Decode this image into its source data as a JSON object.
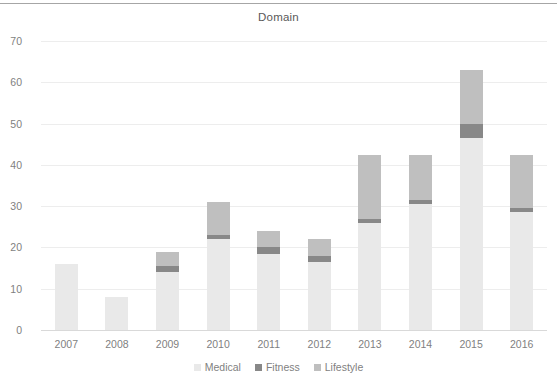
{
  "chart_data": {
    "type": "bar",
    "title": "Domain",
    "xlabel": "",
    "ylabel": "",
    "ylim": [
      0,
      70
    ],
    "yticks": [
      0,
      10,
      20,
      30,
      40,
      50,
      60,
      70
    ],
    "ytick_labels": [
      "0",
      "10",
      "20",
      "30",
      "40",
      "50",
      "60",
      "70"
    ],
    "grid": true,
    "stacked": true,
    "legend_position": "bottom",
    "categories": [
      "2007",
      "2008",
      "2009",
      "2010",
      "2011",
      "2012",
      "2013",
      "2014",
      "2015",
      "2016"
    ],
    "series": [
      {
        "name": "Medical",
        "color": "#e9e9e9",
        "values": [
          16,
          8,
          14,
          22,
          18.5,
          16.5,
          26,
          30.5,
          46.5,
          28.5
        ]
      },
      {
        "name": "Fitness",
        "color": "#888888",
        "values": [
          0,
          0,
          1.5,
          1,
          1.5,
          1.5,
          1,
          1,
          3.5,
          1
        ]
      },
      {
        "name": "Lifestyle",
        "color": "#bfbfbf",
        "values": [
          0,
          0,
          3.5,
          8,
          4,
          4,
          15.5,
          11,
          13,
          13
        ]
      }
    ],
    "totals": [
      16,
      8,
      19,
      31,
      24,
      22,
      42.5,
      42.5,
      63,
      42.5
    ]
  },
  "legend": {
    "items": [
      {
        "label": "Medical",
        "color": "#e9e9e9"
      },
      {
        "label": "Fitness",
        "color": "#888888"
      },
      {
        "label": "Lifestyle",
        "color": "#bfbfbf"
      }
    ]
  },
  "colors": {
    "medical": "#e9e9e9",
    "fitness": "#888888",
    "lifestyle": "#bfbfbf",
    "gridline": "#ededed",
    "axis": "#d9d9d9",
    "text": "#7f7f7f",
    "title_text": "#595959",
    "top_rule": "#a6a6a6"
  }
}
